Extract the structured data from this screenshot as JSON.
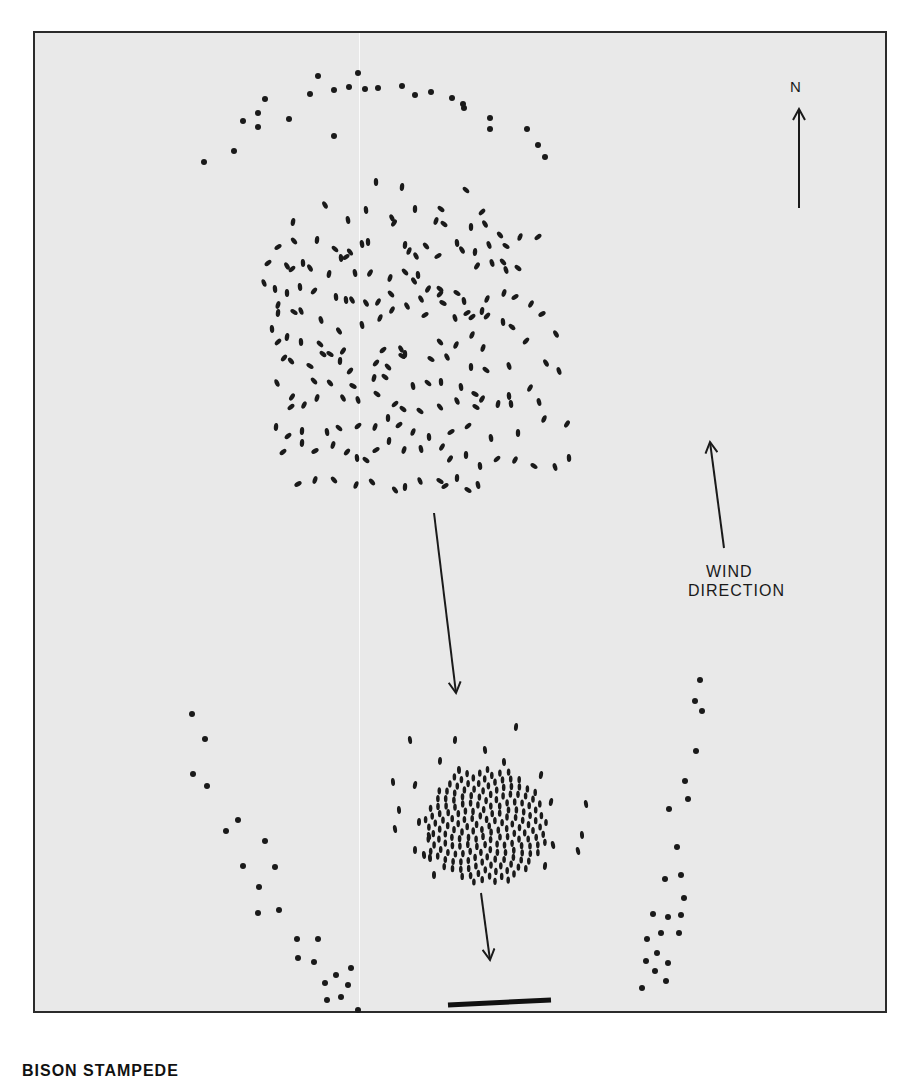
{
  "figure": {
    "north_label": "N",
    "wind_label_line1": "WIND",
    "wind_label_line2": "DIRECTION",
    "caption": "BISON STAMPEDE",
    "colors": {
      "background": "#e9e9e9",
      "ink": "#1a1a1a",
      "frame": "#2b2b2b"
    },
    "arrows": [
      {
        "name": "north-arrow",
        "x1": 799,
        "y1": 208,
        "x2": 799,
        "y2": 109
      },
      {
        "name": "wind-direction-arrow",
        "x1": 724,
        "y1": 548,
        "x2": 710,
        "y2": 442
      },
      {
        "name": "herd-movement-arrow-1",
        "x1": 434,
        "y1": 513,
        "x2": 456,
        "y2": 693
      },
      {
        "name": "herd-movement-arrow-2",
        "x1": 481,
        "y1": 893,
        "x2": 490,
        "y2": 960
      }
    ],
    "scale_bar": {
      "x1": 448,
      "y1": 1005,
      "x2": 551,
      "y2": 1000
    },
    "predator_arc_top": [
      [
        204,
        162
      ],
      [
        234,
        151
      ],
      [
        243,
        121
      ],
      [
        258,
        127
      ],
      [
        258,
        113
      ],
      [
        265,
        99
      ],
      [
        289,
        119
      ],
      [
        310,
        94
      ],
      [
        318,
        76
      ],
      [
        334,
        90
      ],
      [
        334,
        136
      ],
      [
        349,
        87
      ],
      [
        358,
        73
      ],
      [
        365,
        89
      ],
      [
        378,
        88
      ],
      [
        402,
        86
      ],
      [
        415,
        95
      ],
      [
        431,
        92
      ],
      [
        452,
        98
      ],
      [
        464,
        108
      ],
      [
        463,
        104
      ],
      [
        490,
        118
      ],
      [
        490,
        129
      ],
      [
        527,
        129
      ],
      [
        538,
        145
      ],
      [
        545,
        157
      ]
    ],
    "predator_left_flank": [
      [
        192,
        714
      ],
      [
        205,
        739
      ],
      [
        193,
        774
      ],
      [
        207,
        786
      ],
      [
        238,
        820
      ],
      [
        226,
        831
      ],
      [
        265,
        841
      ],
      [
        243,
        866
      ],
      [
        275,
        867
      ],
      [
        259,
        887
      ],
      [
        258,
        913
      ],
      [
        279,
        910
      ],
      [
        297,
        939
      ],
      [
        318,
        939
      ],
      [
        298,
        958
      ],
      [
        314,
        962
      ],
      [
        351,
        968
      ],
      [
        336,
        975
      ],
      [
        325,
        983
      ],
      [
        348,
        985
      ],
      [
        327,
        1000
      ],
      [
        341,
        997
      ],
      [
        358,
        1010
      ]
    ],
    "predator_right_flank": [
      [
        700,
        680
      ],
      [
        695,
        701
      ],
      [
        702,
        711
      ],
      [
        696,
        751
      ],
      [
        685,
        781
      ],
      [
        688,
        799
      ],
      [
        669,
        809
      ],
      [
        677,
        847
      ],
      [
        681,
        875
      ],
      [
        665,
        879
      ],
      [
        684,
        898
      ],
      [
        653,
        914
      ],
      [
        668,
        917
      ],
      [
        681,
        915
      ],
      [
        661,
        933
      ],
      [
        679,
        933
      ],
      [
        647,
        939
      ],
      [
        657,
        953
      ],
      [
        646,
        961
      ],
      [
        668,
        963
      ],
      [
        655,
        971
      ],
      [
        666,
        981
      ],
      [
        642,
        988
      ]
    ],
    "herd_before": [
      [
        376,
        182
      ],
      [
        402,
        187
      ],
      [
        466,
        190
      ],
      [
        325,
        205
      ],
      [
        366,
        210
      ],
      [
        415,
        209
      ],
      [
        441,
        209
      ],
      [
        482,
        212
      ],
      [
        293,
        222
      ],
      [
        348,
        220
      ],
      [
        392,
        218
      ],
      [
        394,
        223
      ],
      [
        436,
        221
      ],
      [
        444,
        224
      ],
      [
        471,
        227
      ],
      [
        485,
        224
      ],
      [
        520,
        237
      ],
      [
        294,
        241
      ],
      [
        317,
        240
      ],
      [
        368,
        242
      ],
      [
        500,
        235
      ],
      [
        506,
        246
      ],
      [
        538,
        237
      ],
      [
        278,
        247
      ],
      [
        335,
        249
      ],
      [
        341,
        258
      ],
      [
        346,
        257
      ],
      [
        350,
        252
      ],
      [
        362,
        244
      ],
      [
        405,
        245
      ],
      [
        409,
        251
      ],
      [
        416,
        256
      ],
      [
        426,
        246
      ],
      [
        438,
        256
      ],
      [
        457,
        243
      ],
      [
        462,
        250
      ],
      [
        475,
        252
      ],
      [
        489,
        245
      ],
      [
        503,
        262
      ],
      [
        477,
        266
      ],
      [
        492,
        263
      ],
      [
        506,
        270
      ],
      [
        518,
        268
      ],
      [
        268,
        263
      ],
      [
        287,
        266
      ],
      [
        292,
        269
      ],
      [
        303,
        263
      ],
      [
        310,
        268
      ],
      [
        329,
        274
      ],
      [
        355,
        273
      ],
      [
        370,
        273
      ],
      [
        390,
        278
      ],
      [
        405,
        272
      ],
      [
        414,
        281
      ],
      [
        418,
        275
      ],
      [
        440,
        289
      ],
      [
        457,
        293
      ],
      [
        464,
        301
      ],
      [
        487,
        299
      ],
      [
        504,
        293
      ],
      [
        515,
        297
      ],
      [
        264,
        283
      ],
      [
        275,
        289
      ],
      [
        287,
        293
      ],
      [
        300,
        287
      ],
      [
        314,
        291
      ],
      [
        336,
        297
      ],
      [
        346,
        300
      ],
      [
        352,
        300
      ],
      [
        366,
        303
      ],
      [
        378,
        302
      ],
      [
        391,
        294
      ],
      [
        421,
        299
      ],
      [
        428,
        289
      ],
      [
        440,
        294
      ],
      [
        467,
        313
      ],
      [
        472,
        317
      ],
      [
        487,
        316
      ],
      [
        531,
        304
      ],
      [
        278,
        305
      ],
      [
        278,
        313
      ],
      [
        294,
        312
      ],
      [
        301,
        311
      ],
      [
        321,
        320
      ],
      [
        339,
        331
      ],
      [
        362,
        325
      ],
      [
        380,
        318
      ],
      [
        392,
        310
      ],
      [
        407,
        306
      ],
      [
        425,
        315
      ],
      [
        443,
        303
      ],
      [
        455,
        318
      ],
      [
        482,
        311
      ],
      [
        503,
        322
      ],
      [
        512,
        327
      ],
      [
        542,
        314
      ],
      [
        272,
        329
      ],
      [
        278,
        342
      ],
      [
        287,
        337
      ],
      [
        301,
        342
      ],
      [
        320,
        344
      ],
      [
        343,
        351
      ],
      [
        383,
        350
      ],
      [
        401,
        349
      ],
      [
        402,
        356
      ],
      [
        440,
        342
      ],
      [
        456,
        345
      ],
      [
        472,
        335
      ],
      [
        483,
        348
      ],
      [
        526,
        341
      ],
      [
        556,
        334
      ],
      [
        284,
        358
      ],
      [
        291,
        361
      ],
      [
        310,
        366
      ],
      [
        323,
        354
      ],
      [
        330,
        354
      ],
      [
        340,
        361
      ],
      [
        350,
        371
      ],
      [
        376,
        363
      ],
      [
        388,
        367
      ],
      [
        405,
        354
      ],
      [
        431,
        359
      ],
      [
        447,
        357
      ],
      [
        471,
        367
      ],
      [
        486,
        370
      ],
      [
        509,
        366
      ],
      [
        546,
        363
      ],
      [
        277,
        383
      ],
      [
        292,
        397
      ],
      [
        314,
        381
      ],
      [
        330,
        383
      ],
      [
        353,
        386
      ],
      [
        374,
        378
      ],
      [
        385,
        377
      ],
      [
        413,
        386
      ],
      [
        428,
        383
      ],
      [
        441,
        382
      ],
      [
        461,
        387
      ],
      [
        475,
        394
      ],
      [
        482,
        399
      ],
      [
        509,
        396
      ],
      [
        530,
        388
      ],
      [
        559,
        371
      ],
      [
        291,
        407
      ],
      [
        304,
        405
      ],
      [
        317,
        398
      ],
      [
        343,
        398
      ],
      [
        358,
        400
      ],
      [
        377,
        394
      ],
      [
        395,
        404
      ],
      [
        403,
        409
      ],
      [
        420,
        411
      ],
      [
        440,
        407
      ],
      [
        457,
        401
      ],
      [
        476,
        407
      ],
      [
        498,
        404
      ],
      [
        511,
        404
      ],
      [
        539,
        402
      ],
      [
        276,
        427
      ],
      [
        288,
        436
      ],
      [
        302,
        431
      ],
      [
        327,
        432
      ],
      [
        339,
        428
      ],
      [
        358,
        426
      ],
      [
        375,
        427
      ],
      [
        388,
        418
      ],
      [
        399,
        425
      ],
      [
        413,
        432
      ],
      [
        429,
        437
      ],
      [
        451,
        432
      ],
      [
        468,
        426
      ],
      [
        491,
        438
      ],
      [
        518,
        433
      ],
      [
        544,
        419
      ],
      [
        567,
        424
      ],
      [
        283,
        452
      ],
      [
        302,
        443
      ],
      [
        315,
        451
      ],
      [
        333,
        445
      ],
      [
        347,
        452
      ],
      [
        357,
        458
      ],
      [
        366,
        460
      ],
      [
        376,
        450
      ],
      [
        389,
        441
      ],
      [
        404,
        450
      ],
      [
        421,
        449
      ],
      [
        442,
        447
      ],
      [
        450,
        459
      ],
      [
        466,
        455
      ],
      [
        480,
        466
      ],
      [
        497,
        459
      ],
      [
        515,
        460
      ],
      [
        534,
        466
      ],
      [
        555,
        467
      ],
      [
        569,
        458
      ],
      [
        298,
        484
      ],
      [
        315,
        480
      ],
      [
        334,
        480
      ],
      [
        356,
        485
      ],
      [
        372,
        482
      ],
      [
        395,
        490
      ],
      [
        405,
        487
      ],
      [
        420,
        481
      ],
      [
        440,
        481
      ],
      [
        445,
        486
      ],
      [
        457,
        478
      ],
      [
        468,
        490
      ],
      [
        478,
        485
      ]
    ],
    "herd_after_outer": [
      [
        410,
        740
      ],
      [
        455,
        740
      ],
      [
        485,
        750
      ],
      [
        516,
        727
      ],
      [
        393,
        782
      ],
      [
        415,
        785
      ],
      [
        440,
        761
      ],
      [
        504,
        762
      ],
      [
        541,
        775
      ],
      [
        586,
        804
      ],
      [
        399,
        810
      ],
      [
        459,
        770
      ],
      [
        551,
        802
      ],
      [
        419,
        822
      ],
      [
        429,
        836
      ],
      [
        395,
        829
      ],
      [
        415,
        850
      ],
      [
        424,
        855
      ],
      [
        430,
        858
      ],
      [
        434,
        875
      ],
      [
        582,
        835
      ],
      [
        578,
        851
      ],
      [
        553,
        845
      ],
      [
        545,
        866
      ]
    ],
    "herd_after_dense": {
      "center": [
        486,
        826
      ],
      "radius_x": 62,
      "radius_y": 58,
      "count": 190
    }
  }
}
